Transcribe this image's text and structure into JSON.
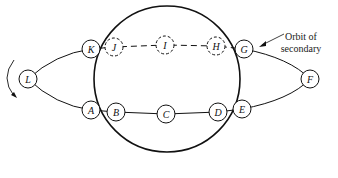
{
  "diagram": {
    "annotation": {
      "line1": "Orbit of",
      "line2": "secondary"
    },
    "nodes": [
      {
        "id": "A",
        "x": 91,
        "y": 110,
        "dashed": false
      },
      {
        "id": "B",
        "x": 116,
        "y": 112,
        "dashed": false
      },
      {
        "id": "C",
        "x": 166,
        "y": 114,
        "dashed": false
      },
      {
        "id": "D",
        "x": 218,
        "y": 112,
        "dashed": false
      },
      {
        "id": "E",
        "x": 242,
        "y": 109,
        "dashed": false
      },
      {
        "id": "F",
        "x": 310,
        "y": 79,
        "dashed": false
      },
      {
        "id": "G",
        "x": 244,
        "y": 49,
        "dashed": false
      },
      {
        "id": "H",
        "x": 216,
        "y": 46,
        "dashed": true
      },
      {
        "id": "I",
        "x": 165,
        "y": 45,
        "dashed": true
      },
      {
        "id": "J",
        "x": 114,
        "y": 47,
        "dashed": true
      },
      {
        "id": "K",
        "x": 91,
        "y": 49,
        "dashed": false
      },
      {
        "id": "L",
        "x": 28,
        "y": 79,
        "dashed": false
      }
    ],
    "primary": {
      "cx": 167,
      "cy": 79,
      "r": 73
    }
  }
}
